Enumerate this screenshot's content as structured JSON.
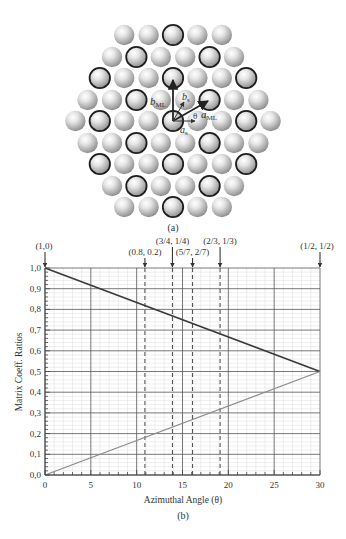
{
  "panel_a": {
    "caption": "(a)",
    "lattice": {
      "center_x": 173,
      "spacing": 24.4,
      "rows": [
        {
          "y": 35,
          "count": 5,
          "dark_offsets": [
            0
          ]
        },
        {
          "y": 57,
          "count": 6,
          "dark_offsets": [
            -1.5,
            1.5
          ]
        },
        {
          "y": 78,
          "count": 7,
          "dark_offsets": [
            -3,
            0,
            3
          ]
        },
        {
          "y": 100,
          "count": 8,
          "dark_offsets": [
            -1.5,
            1.5
          ]
        },
        {
          "y": 121,
          "count": 9,
          "dark_offsets": [
            -3,
            0,
            3
          ]
        },
        {
          "y": 143,
          "count": 8,
          "dark_offsets": [
            -1.5,
            1.5
          ]
        },
        {
          "y": 164,
          "count": 7,
          "dark_offsets": [
            -3,
            0,
            3
          ]
        },
        {
          "y": 186,
          "count": 6,
          "dark_offsets": [
            -1.5,
            1.5
          ]
        },
        {
          "y": 207,
          "count": 5,
          "dark_offsets": [
            0
          ]
        }
      ]
    },
    "vector_labels": {
      "b_ML": "b",
      "b_ML_sub": "ML",
      "b_s": "b",
      "b_s_sub": "s",
      "a_ML": "a",
      "a_ML_sub": "ML",
      "a_s": "a",
      "a_s_sub": "s",
      "theta": "θ"
    }
  },
  "panel_b": {
    "caption": "(b)"
  },
  "chart_data": {
    "type": "line",
    "title": "",
    "xlabel": "Azimuthal Angle (θ)",
    "ylabel": "Matrix Coeff. Ratios",
    "xlim": [
      0,
      30
    ],
    "ylim": [
      0.0,
      1.0
    ],
    "xticks": [
      0,
      5,
      10,
      15,
      20,
      25,
      30
    ],
    "yticks": [
      "0,0",
      "0,1",
      "0,2",
      "0,3",
      "0,4",
      "0,5",
      "0,6",
      "0,7",
      "0,8",
      "0,9",
      "1,0"
    ],
    "grid": true,
    "minor_grid": true,
    "series": [
      {
        "name": "upper (dark)",
        "color": "#3a3a3a",
        "x": [
          0,
          30
        ],
        "y": [
          1.0,
          0.5
        ]
      },
      {
        "name": "lower (light)",
        "color": "#8a8a8a",
        "x": [
          0,
          30
        ],
        "y": [
          0.0,
          0.5
        ]
      }
    ],
    "annotations": [
      {
        "label": "(1,0)",
        "x": 0,
        "style": "arrow"
      },
      {
        "label": "(0.8, 0.2)",
        "x": 10.9,
        "style": "dashed"
      },
      {
        "label": "(3/4, 1/4)",
        "x": 13.9,
        "style": "dashed"
      },
      {
        "label": "(5/7, 2/7)",
        "x": 16.1,
        "style": "dashed"
      },
      {
        "label": "(2/3, 1/3)",
        "x": 19.1,
        "style": "dashed"
      },
      {
        "label": "(1/2, 1/2)",
        "x": 30,
        "style": "arrow"
      }
    ],
    "colors": {
      "axis": "#444444",
      "major_grid": "#555555",
      "minor_grid": "#e2e2e2",
      "dashed": "#333333"
    }
  }
}
